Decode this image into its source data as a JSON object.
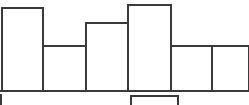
{
  "chart_data": {
    "type": "bar",
    "title": "",
    "subtitle": "",
    "xlabel": "",
    "ylabel": "",
    "categories": [
      "1",
      "2",
      "3",
      "4",
      "5",
      "6"
    ],
    "values": [
      83,
      45,
      68,
      86,
      45,
      45
    ],
    "ylim": [
      0,
      105
    ],
    "xlim": [
      0,
      249
    ],
    "grid": false,
    "legend": false,
    "legend_position": "none",
    "annotations": [],
    "tick_labels": {
      "x": [],
      "y": []
    },
    "style": {
      "bars_filled": false,
      "bar_fill": "#ffffff",
      "bar_stroke": "#3a3a3a",
      "background": "#ffffff",
      "axis_color": "#3a3a3a"
    },
    "bars": [
      {
        "name": "bar-1",
        "x0": 2,
        "x1": 43,
        "top": 8,
        "height": 83,
        "value": 83
      },
      {
        "name": "bar-2",
        "x0": 43,
        "x1": 86,
        "top": 46,
        "height": 45,
        "value": 45
      },
      {
        "name": "bar-3",
        "x0": 86,
        "x1": 128,
        "top": 23,
        "height": 68,
        "value": 68
      },
      {
        "name": "bar-4",
        "x0": 128,
        "x1": 171,
        "top": 5,
        "height": 86,
        "value": 86
      },
      {
        "name": "bar-5",
        "x0": 171,
        "x1": 212,
        "top": 46,
        "height": 45,
        "value": 45
      },
      {
        "name": "bar-6",
        "x0": 212,
        "x1": 249,
        "top": 46,
        "height": 45,
        "value": 45
      }
    ],
    "baseline_y": 91
  },
  "chart": {
    "caption_box": {
      "name": "below-axis-box",
      "x0": 131,
      "x1": 178,
      "top": 96,
      "text": ""
    },
    "left_tick": {
      "name": "below-axis-left-tick",
      "x": 1,
      "top": 94
    }
  }
}
